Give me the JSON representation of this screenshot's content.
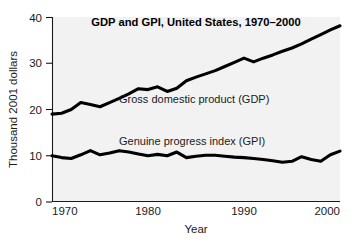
{
  "chart_data": {
    "type": "line",
    "title": "GDP and GPI, United States, 1970–2000",
    "xlabel": "Year",
    "ylabel": "Thousand 2001 dollars",
    "xlim": [
      1970,
      2000
    ],
    "ylim": [
      0,
      40
    ],
    "xticks": [
      "1970",
      "1980",
      "1990",
      "2000"
    ],
    "xtick_values": [
      1970,
      1980,
      1990,
      2000
    ],
    "yticks": [
      "0",
      "10",
      "20",
      "30",
      "40"
    ],
    "ytick_values": [
      0,
      10,
      20,
      30,
      40
    ],
    "grid": false,
    "legend_position": "inline-annotation",
    "line_color": "#000000",
    "plot_background": "#f2f2f2",
    "figure_background": "#ffffff",
    "x": [
      1970,
      1971,
      1972,
      1973,
      1974,
      1975,
      1976,
      1977,
      1978,
      1979,
      1980,
      1981,
      1982,
      1983,
      1984,
      1985,
      1986,
      1987,
      1988,
      1989,
      1990,
      1991,
      1992,
      1993,
      1994,
      1995,
      1996,
      1997,
      1998,
      1999,
      2000
    ],
    "series": [
      {
        "name": "Gross domestic product (GDP)",
        "label": "Gross domestic product (GDP)",
        "color": "#000000",
        "values": [
          19.0,
          19.2,
          20.0,
          21.5,
          21.1,
          20.6,
          21.5,
          22.4,
          23.4,
          24.5,
          24.3,
          24.9,
          23.9,
          24.6,
          26.2,
          27.0,
          27.7,
          28.4,
          29.3,
          30.2,
          31.1,
          30.3,
          31.1,
          31.8,
          32.6,
          33.3,
          34.2,
          35.2,
          36.2,
          37.2,
          38.1
        ]
      },
      {
        "name": "Genuine progress index (GPI)",
        "label": "Genuine progress index (GPI)",
        "color": "#000000",
        "values": [
          10.0,
          9.6,
          9.4,
          10.2,
          11.1,
          10.2,
          10.6,
          11.1,
          10.8,
          10.4,
          10.0,
          10.3,
          10.0,
          10.8,
          9.6,
          9.9,
          10.1,
          10.1,
          9.9,
          9.7,
          9.6,
          9.4,
          9.2,
          8.9,
          8.6,
          8.8,
          9.8,
          9.2,
          8.8,
          10.2,
          11.0
        ]
      }
    ],
    "annotations": [
      {
        "name": "gdp-series-label",
        "text": "Gross domestic product (GDP)",
        "x_year": 1981.5,
        "y_value": 21.3
      },
      {
        "name": "gpi-series-label",
        "text": "Genuine progress index (GPI)",
        "x_year": 1981.5,
        "y_value": 13.0
      }
    ]
  }
}
